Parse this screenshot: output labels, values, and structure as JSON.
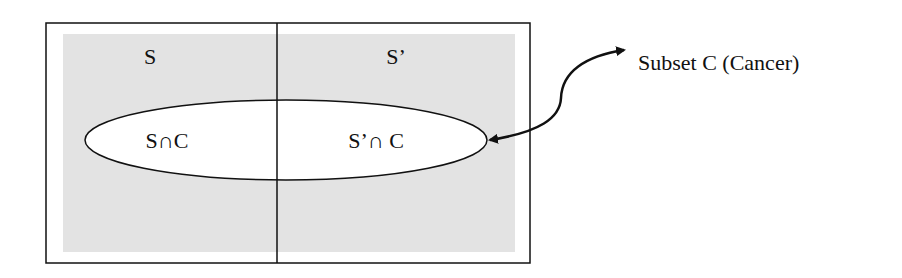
{
  "diagram": {
    "type": "venn-partition",
    "colors": {
      "outline": "#111111",
      "region_fill": "#e3e3e3",
      "subset_fill": "#ffffff",
      "background": "#ffffff"
    },
    "regions": {
      "left_label": "S",
      "right_label": "S’"
    },
    "subset": {
      "left_label": "S∩C",
      "right_label": "S’∩ C"
    },
    "callout": {
      "label": "Subset C (Cancer)",
      "arrow": "double-headed-curved"
    }
  }
}
